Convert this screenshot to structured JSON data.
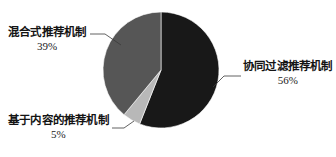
{
  "chart_data": {
    "type": "pie",
    "title": "",
    "subtitle": "",
    "xlabel": "",
    "ylabel": "",
    "legend_position": "none",
    "grid": false,
    "labels_outside": true,
    "start_angle_deg": 0,
    "direction": "clockwise",
    "categories": [
      "协同过滤推荐机制",
      "基于内容的推荐机制",
      "混合式推荐机制"
    ],
    "values": [
      56,
      5,
      39
    ],
    "value_unit": "%",
    "slices": [
      {
        "label": "协同过滤推荐机制",
        "value": 56,
        "percent_text": "56%",
        "color": "#181818",
        "label_position": "right"
      },
      {
        "label": "基于内容的推荐机制",
        "value": 5,
        "percent_text": "5%",
        "color": "#b8b8b8",
        "label_position": "bottom-left"
      },
      {
        "label": "混合式推荐机制",
        "value": 39,
        "percent_text": "39%",
        "color": "#565656",
        "label_position": "top-left"
      }
    ]
  },
  "colors": {
    "background": "#ffffff",
    "slice_collaborative": "#181818",
    "slice_content_based": "#b8b8b8",
    "slice_hybrid": "#565656",
    "leader_line": "#3a3a3a",
    "text": "#141414"
  },
  "labels": {
    "right": {
      "name": "协同过滤推荐机制",
      "percent": "56%"
    },
    "left_top": {
      "name": "混合式推荐机制",
      "percent": "39%"
    },
    "left_bottom": {
      "name": "基于内容的推荐机制",
      "percent": "5%"
    }
  }
}
